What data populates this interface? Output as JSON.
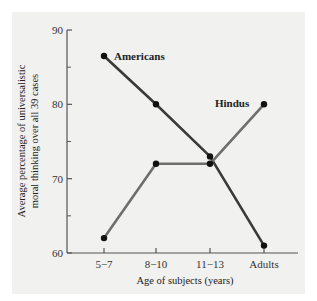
{
  "chart_data": {
    "type": "line",
    "title": "",
    "xlabel": "Age of subjects (years)",
    "ylabel": "Average percentage of universalistic moral thinking over all 39 cases",
    "ylabel_lines": [
      "Average percentage of universalistic",
      "moral thinking over all 39 cases"
    ],
    "categories": [
      "5−7",
      "8−10",
      "11−13",
      "Adults"
    ],
    "ylim": [
      60,
      90
    ],
    "yticks": [
      60,
      70,
      80,
      90
    ],
    "yticks_minor": [
      65,
      75,
      85
    ],
    "grid": false,
    "legend": "inline labels",
    "series": [
      {
        "name": "Americans",
        "values": [
          86.5,
          80,
          73,
          61
        ],
        "color": "#3a3a3a"
      },
      {
        "name": "Hindus",
        "values": [
          62,
          72,
          72,
          80
        ],
        "color": "#6e6e6e"
      }
    ]
  }
}
